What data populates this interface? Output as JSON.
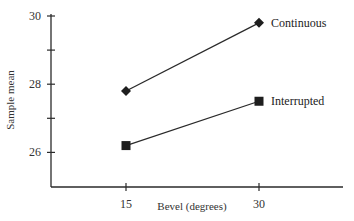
{
  "chart_data": {
    "type": "line",
    "title": "",
    "xlabel": "Bevel (degrees)",
    "ylabel": "Sample mean",
    "x": [
      15,
      30
    ],
    "categories": [
      "15",
      "30"
    ],
    "xticks": [
      "15",
      "30"
    ],
    "yticks": [
      26,
      27,
      28,
      29,
      30
    ],
    "ytick_labels": [
      "26",
      "28",
      "30"
    ],
    "ylim": [
      25,
      30
    ],
    "grid": false,
    "legend": "inline labels at right end of each line",
    "series": [
      {
        "name": "Continuous",
        "marker": "diamond",
        "values": [
          27.8,
          29.8
        ]
      },
      {
        "name": "Interrupted",
        "marker": "square",
        "values": [
          26.2,
          27.5
        ]
      }
    ],
    "colors": {
      "line": "#2a2a2a",
      "axis": "#2a2a2a",
      "background": "#ffffff"
    }
  }
}
